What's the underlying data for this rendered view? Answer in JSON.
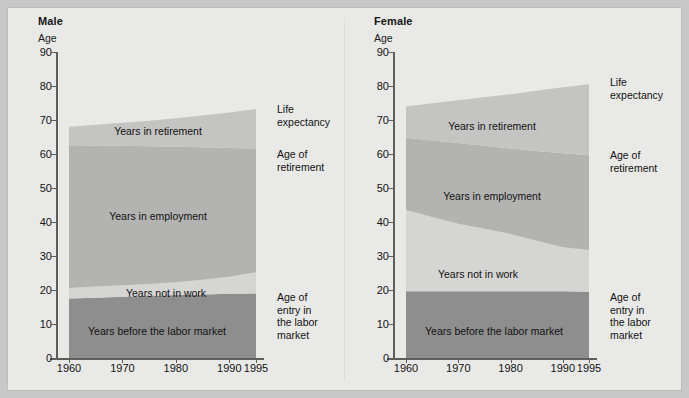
{
  "figure": {
    "background_color": "#e9e9e7",
    "colors": {
      "before_labor_market": "#8e8e8e",
      "not_in_work": "#d5d5d3",
      "employment": "#b3b3b1",
      "retirement": "#c4c4c2",
      "axis": "#5e5e5e",
      "text": "#121212"
    }
  },
  "panels": [
    {
      "id": "male",
      "title": "Male",
      "y_axis_label": "Age",
      "y_ticks": [
        0,
        10,
        20,
        30,
        40,
        50,
        60,
        70,
        80,
        90
      ],
      "x_ticks": [
        "1960",
        "1970",
        "1980",
        "1990",
        "1995"
      ],
      "band_labels": {
        "retirement": "Years in retirement",
        "employment": "Years in employment",
        "not_in_work": "Years not in work",
        "before_labor_market": "Years before the labor market"
      },
      "side_labels": {
        "life_expectancy": "Life\nexpectancy",
        "age_of_retirement": "Age of\nretirement",
        "age_of_entry": "Age of\nentry in\nthe labor\nmarket"
      }
    },
    {
      "id": "female",
      "title": "Female",
      "y_axis_label": "Age",
      "y_ticks": [
        0,
        10,
        20,
        30,
        40,
        50,
        60,
        70,
        80,
        90
      ],
      "x_ticks": [
        "1960",
        "1970",
        "1980",
        "1990",
        "1995"
      ],
      "band_labels": {
        "retirement": "Years in retirement",
        "employment": "Years in employment",
        "not_in_work": "Years not in work",
        "before_labor_market": "Years before the labor market"
      },
      "side_labels": {
        "life_expectancy": "Life\nexpectancy",
        "age_of_retirement": "Age of\nretirement",
        "age_of_entry": "Age of\nentry in\nthe labor\nmarket"
      }
    }
  ],
  "chart_data": [
    {
      "type": "area",
      "id": "male",
      "title": "Male",
      "xlabel": "",
      "ylabel": "Age",
      "ylim": [
        0,
        90
      ],
      "xlim": [
        1960,
        1995
      ],
      "grid": false,
      "legend": "inline band labels",
      "x": [
        1960,
        1965,
        1970,
        1975,
        1980,
        1985,
        1990,
        1995
      ],
      "boundaries": {
        "age_of_entry_in_the_labor_market": [
          17.5,
          17.7,
          18.0,
          18.2,
          18.5,
          18.7,
          18.9,
          19.0
        ],
        "end_of_years_not_in_work": [
          20.6,
          21.0,
          21.4,
          21.8,
          22.3,
          23.0,
          23.9,
          25.2
        ],
        "age_of_retirement": [
          62.6,
          62.5,
          62.4,
          62.3,
          62.1,
          62.0,
          61.8,
          61.6
        ],
        "life_expectancy": [
          68.0,
          68.6,
          69.2,
          69.8,
          70.5,
          71.3,
          72.2,
          73.2
        ]
      },
      "series": [
        {
          "name": "Years before the labor market",
          "values": [
            17.5,
            17.7,
            18.0,
            18.2,
            18.5,
            18.7,
            18.9,
            19.0
          ]
        },
        {
          "name": "Years not in work",
          "values": [
            3.1,
            3.3,
            3.4,
            3.6,
            3.8,
            4.3,
            5.0,
            6.2
          ]
        },
        {
          "name": "Years in employment",
          "values": [
            42.0,
            41.5,
            41.0,
            40.5,
            39.8,
            39.0,
            37.9,
            36.4
          ]
        },
        {
          "name": "Years in retirement",
          "values": [
            5.4,
            6.1,
            6.8,
            7.5,
            8.4,
            9.3,
            10.4,
            11.6
          ]
        }
      ]
    },
    {
      "type": "area",
      "id": "female",
      "title": "Female",
      "xlabel": "",
      "ylabel": "Age",
      "ylim": [
        0,
        90
      ],
      "xlim": [
        1960,
        1995
      ],
      "grid": false,
      "legend": "inline band labels",
      "x": [
        1960,
        1965,
        1970,
        1975,
        1980,
        1985,
        1990,
        1995
      ],
      "boundaries": {
        "age_of_entry_in_the_labor_market": [
          19.6,
          19.6,
          19.6,
          19.6,
          19.6,
          19.6,
          19.6,
          19.5
        ],
        "end_of_years_not_in_work": [
          43.5,
          41.5,
          39.5,
          38.0,
          36.5,
          34.5,
          32.6,
          31.8
        ],
        "age_of_retirement": [
          64.8,
          64.0,
          63.2,
          62.4,
          61.6,
          60.9,
          60.2,
          59.6
        ],
        "life_expectancy": [
          74.0,
          74.9,
          75.8,
          76.7,
          77.6,
          78.6,
          79.6,
          80.5
        ]
      },
      "series": [
        {
          "name": "Years before the labor market",
          "values": [
            19.6,
            19.6,
            19.6,
            19.6,
            19.6,
            19.6,
            19.6,
            19.5
          ]
        },
        {
          "name": "Years not in work",
          "values": [
            23.9,
            21.9,
            19.9,
            18.4,
            16.9,
            14.9,
            13.0,
            12.3
          ]
        },
        {
          "name": "Years in employment",
          "values": [
            21.3,
            22.5,
            23.7,
            24.4,
            25.1,
            26.4,
            27.6,
            27.8
          ]
        },
        {
          "name": "Years in retirement",
          "values": [
            9.2,
            10.9,
            12.6,
            14.3,
            16.0,
            17.7,
            19.4,
            20.9
          ]
        }
      ]
    }
  ]
}
